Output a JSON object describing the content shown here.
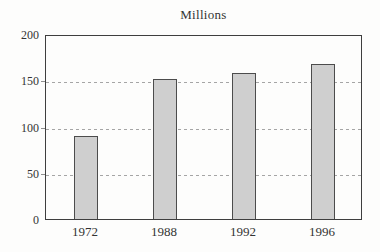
{
  "chart_data": {
    "type": "bar",
    "title": "Millions",
    "categories": [
      "1972",
      "1988",
      "1992",
      "1996"
    ],
    "values": [
      90,
      151,
      158,
      168
    ],
    "xlabel": "",
    "ylabel": "",
    "ylim": [
      0,
      200
    ],
    "yticks": [
      0,
      50,
      100,
      150,
      200
    ],
    "gridlines": [
      50,
      100,
      150
    ],
    "grid_style": "dashed-horizontal",
    "legend_position": "none",
    "colors": {
      "bar_fill": "#cfcfcf",
      "bar_border": "#4c4c4c",
      "axis_border": "#3e3e3e",
      "gridline": "#a5a5a5",
      "text": "#333333",
      "background": "#fdfdfc"
    }
  }
}
